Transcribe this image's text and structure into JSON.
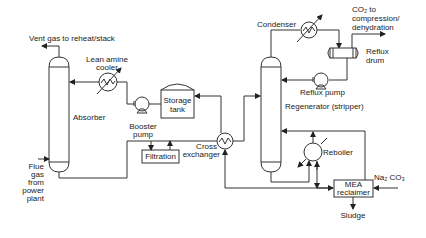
{
  "diagram": {
    "type": "process-flow",
    "title": "",
    "colors": {
      "line": "#333333",
      "text": "#222222",
      "background": "#ffffff"
    },
    "labels": {
      "vent_gas": "Vent gas to reheat/stack",
      "lean_amine_cooler_1": "Lean amine",
      "lean_amine_cooler_2": "cooler",
      "absorber": "Absorber",
      "storage_tank_1": "Storage",
      "storage_tank_2": "tank",
      "booster_pump_1": "Booster",
      "booster_pump_2": "pump",
      "filtration": "Filtration",
      "cross_exchanger_1": "Cross",
      "cross_exchanger_2": "exchanger",
      "flue_gas_1": "Flue",
      "flue_gas_2": "gas",
      "flue_gas_3": "from",
      "flue_gas_4": "power",
      "flue_gas_5": "plant",
      "condenser": "Condenser",
      "co2_1": "CO₂ to",
      "co2_2": "compression/",
      "co2_3": "dehydration",
      "reflux_drum_1": "Reflux",
      "reflux_drum_2": "drum",
      "reflux_pump": "Reflux pump",
      "regenerator": "Regenerator (stripper)",
      "reboiler": "Reboiler",
      "na2co3": "Na₂ CO₃",
      "mea_reclaimer_1": "MEA",
      "mea_reclaimer_2": "reclaimer",
      "sludge": "Sludge"
    },
    "nodes": [
      {
        "id": "absorber",
        "label": "Absorber",
        "shape": "column"
      },
      {
        "id": "lean-amine-cooler",
        "label": "Lean amine cooler",
        "shape": "heat-exchanger"
      },
      {
        "id": "booster-pump",
        "label": "Booster pump",
        "shape": "pump"
      },
      {
        "id": "storage-tank",
        "label": "Storage tank",
        "shape": "tank"
      },
      {
        "id": "filtration",
        "label": "Filtration",
        "shape": "box"
      },
      {
        "id": "cross-exchanger",
        "label": "Cross exchanger",
        "shape": "heat-exchanger"
      },
      {
        "id": "regenerator",
        "label": "Regenerator (stripper)",
        "shape": "column"
      },
      {
        "id": "condenser",
        "label": "Condenser",
        "shape": "heat-exchanger"
      },
      {
        "id": "reflux-drum",
        "label": "Reflux drum",
        "shape": "drum"
      },
      {
        "id": "reflux-pump",
        "label": "Reflux pump",
        "shape": "pump"
      },
      {
        "id": "reboiler",
        "label": "Reboiler",
        "shape": "heat-exchanger"
      },
      {
        "id": "mea-reclaimer",
        "label": "MEA reclaimer",
        "shape": "box"
      }
    ],
    "edges": [
      {
        "from": "flue-gas",
        "to": "absorber"
      },
      {
        "from": "absorber",
        "to": "vent-gas"
      },
      {
        "from": "absorber",
        "to": "cross-exchanger"
      },
      {
        "from": "cross-exchanger",
        "to": "regenerator"
      },
      {
        "from": "regenerator",
        "to": "condenser"
      },
      {
        "from": "condenser",
        "to": "reflux-drum"
      },
      {
        "from": "reflux-drum",
        "to": "co2-out"
      },
      {
        "from": "reflux-drum",
        "to": "reflux-pump"
      },
      {
        "from": "reflux-pump",
        "to": "regenerator"
      },
      {
        "from": "regenerator",
        "to": "reboiler"
      },
      {
        "from": "reboiler",
        "to": "regenerator"
      },
      {
        "from": "reboiler",
        "to": "mea-reclaimer"
      },
      {
        "from": "na2co3",
        "to": "mea-reclaimer"
      },
      {
        "from": "mea-reclaimer",
        "to": "regenerator"
      },
      {
        "from": "mea-reclaimer",
        "to": "sludge"
      },
      {
        "from": "regenerator",
        "to": "cross-exchanger"
      },
      {
        "from": "cross-exchanger",
        "to": "storage-tank"
      },
      {
        "from": "storage-tank",
        "to": "booster-pump"
      },
      {
        "from": "booster-pump",
        "to": "lean-amine-cooler"
      },
      {
        "from": "lean-amine-cooler",
        "to": "absorber"
      },
      {
        "from": "filtration",
        "to": "cross-exchanger-line"
      }
    ]
  }
}
